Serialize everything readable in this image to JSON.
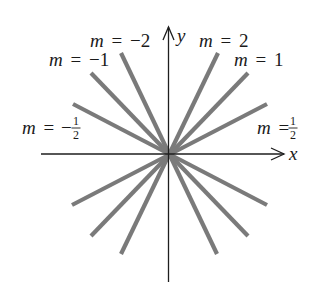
{
  "diagram": {
    "axes": {
      "x_label": "x",
      "y_label": "y"
    },
    "lines": [
      {
        "slope": "2",
        "label_var": "m",
        "label_eq": "=",
        "label_value": "2"
      },
      {
        "slope": "1",
        "label_var": "m",
        "label_eq": "=",
        "label_value": "1"
      },
      {
        "slope": "1/2",
        "label_var": "m",
        "label_eq": "=",
        "label_num": "1",
        "label_den": "2"
      },
      {
        "slope": "-2",
        "label_var": "m",
        "label_eq": "=",
        "label_value": "−2"
      },
      {
        "slope": "-1",
        "label_var": "m",
        "label_eq": "=",
        "label_value": "−1"
      },
      {
        "slope": "-1/2",
        "label_var": "m",
        "label_eq": "=",
        "label_sign": "−",
        "label_num": "1",
        "label_den": "2"
      }
    ],
    "colors": {
      "axis": "#1e1e1e",
      "ray": "#7a7a7a",
      "text": "#1a1a1a"
    }
  }
}
